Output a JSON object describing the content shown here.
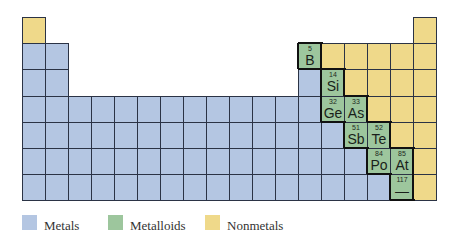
{
  "colors": {
    "metals": "#b4c6e2",
    "metalloids": "#9dc69d",
    "nonmetals": "#efd98a",
    "grid_line": "#2b3345"
  },
  "grid": {
    "left": 22,
    "top": 17,
    "cell_w": 23,
    "cell_h": 26.2,
    "columns": 18,
    "rows": 7
  },
  "rows": [
    {
      "row": 1,
      "cells": [
        {
          "col": 1,
          "type": "nonmetal"
        },
        {
          "col": 18,
          "type": "nonmetal"
        }
      ]
    },
    {
      "row": 2,
      "cells": [
        {
          "col": 1,
          "type": "metal"
        },
        {
          "col": 2,
          "type": "metal"
        },
        {
          "col": 13,
          "type": "metalloid",
          "number": "5",
          "symbol": "B"
        },
        {
          "col": 14,
          "type": "nonmetal"
        },
        {
          "col": 15,
          "type": "nonmetal"
        },
        {
          "col": 16,
          "type": "nonmetal"
        },
        {
          "col": 17,
          "type": "nonmetal"
        },
        {
          "col": 18,
          "type": "nonmetal"
        }
      ]
    },
    {
      "row": 3,
      "cells": [
        {
          "col": 1,
          "type": "metal"
        },
        {
          "col": 2,
          "type": "metal"
        },
        {
          "col": 13,
          "type": "metal"
        },
        {
          "col": 14,
          "type": "metalloid",
          "number": "14",
          "symbol": "Si"
        },
        {
          "col": 15,
          "type": "nonmetal"
        },
        {
          "col": 16,
          "type": "nonmetal"
        },
        {
          "col": 17,
          "type": "nonmetal"
        },
        {
          "col": 18,
          "type": "nonmetal"
        }
      ]
    },
    {
      "row": 4,
      "cells": [
        {
          "col": 1,
          "type": "metal"
        },
        {
          "col": 2,
          "type": "metal"
        },
        {
          "col": 3,
          "type": "metal"
        },
        {
          "col": 4,
          "type": "metal"
        },
        {
          "col": 5,
          "type": "metal"
        },
        {
          "col": 6,
          "type": "metal"
        },
        {
          "col": 7,
          "type": "metal"
        },
        {
          "col": 8,
          "type": "metal"
        },
        {
          "col": 9,
          "type": "metal"
        },
        {
          "col": 10,
          "type": "metal"
        },
        {
          "col": 11,
          "type": "metal"
        },
        {
          "col": 12,
          "type": "metal"
        },
        {
          "col": 13,
          "type": "metal"
        },
        {
          "col": 14,
          "type": "metalloid",
          "number": "32",
          "symbol": "Ge"
        },
        {
          "col": 15,
          "type": "metalloid",
          "number": "33",
          "symbol": "As"
        },
        {
          "col": 16,
          "type": "nonmetal"
        },
        {
          "col": 17,
          "type": "nonmetal"
        },
        {
          "col": 18,
          "type": "nonmetal"
        }
      ]
    },
    {
      "row": 5,
      "cells": [
        {
          "col": 1,
          "type": "metal"
        },
        {
          "col": 2,
          "type": "metal"
        },
        {
          "col": 3,
          "type": "metal"
        },
        {
          "col": 4,
          "type": "metal"
        },
        {
          "col": 5,
          "type": "metal"
        },
        {
          "col": 6,
          "type": "metal"
        },
        {
          "col": 7,
          "type": "metal"
        },
        {
          "col": 8,
          "type": "metal"
        },
        {
          "col": 9,
          "type": "metal"
        },
        {
          "col": 10,
          "type": "metal"
        },
        {
          "col": 11,
          "type": "metal"
        },
        {
          "col": 12,
          "type": "metal"
        },
        {
          "col": 13,
          "type": "metal"
        },
        {
          "col": 14,
          "type": "metal"
        },
        {
          "col": 15,
          "type": "metalloid",
          "number": "51",
          "symbol": "Sb"
        },
        {
          "col": 16,
          "type": "metalloid",
          "number": "52",
          "symbol": "Te"
        },
        {
          "col": 17,
          "type": "nonmetal"
        },
        {
          "col": 18,
          "type": "nonmetal"
        }
      ]
    },
    {
      "row": 6,
      "cells": [
        {
          "col": 1,
          "type": "metal"
        },
        {
          "col": 2,
          "type": "metal"
        },
        {
          "col": 3,
          "type": "metal"
        },
        {
          "col": 4,
          "type": "metal"
        },
        {
          "col": 5,
          "type": "metal"
        },
        {
          "col": 6,
          "type": "metal"
        },
        {
          "col": 7,
          "type": "metal"
        },
        {
          "col": 8,
          "type": "metal"
        },
        {
          "col": 9,
          "type": "metal"
        },
        {
          "col": 10,
          "type": "metal"
        },
        {
          "col": 11,
          "type": "metal"
        },
        {
          "col": 12,
          "type": "metal"
        },
        {
          "col": 13,
          "type": "metal"
        },
        {
          "col": 14,
          "type": "metal"
        },
        {
          "col": 15,
          "type": "metal"
        },
        {
          "col": 16,
          "type": "metalloid",
          "number": "84",
          "symbol": "Po"
        },
        {
          "col": 17,
          "type": "metalloid",
          "number": "85",
          "symbol": "At"
        },
        {
          "col": 18,
          "type": "nonmetal"
        }
      ]
    },
    {
      "row": 7,
      "cells": [
        {
          "col": 1,
          "type": "metal"
        },
        {
          "col": 2,
          "type": "metal"
        },
        {
          "col": 3,
          "type": "metal"
        },
        {
          "col": 4,
          "type": "metal"
        },
        {
          "col": 5,
          "type": "metal"
        },
        {
          "col": 6,
          "type": "metal"
        },
        {
          "col": 7,
          "type": "metal"
        },
        {
          "col": 8,
          "type": "metal"
        },
        {
          "col": 9,
          "type": "metal"
        },
        {
          "col": 10,
          "type": "metal"
        },
        {
          "col": 11,
          "type": "metal"
        },
        {
          "col": 12,
          "type": "metal"
        },
        {
          "col": 13,
          "type": "metal"
        },
        {
          "col": 14,
          "type": "metal"
        },
        {
          "col": 15,
          "type": "metal"
        },
        {
          "col": 16,
          "type": "metal"
        },
        {
          "col": 17,
          "type": "metalloid",
          "number": "117",
          "symbol": "—"
        },
        {
          "col": 18,
          "type": "nonmetal"
        }
      ]
    }
  ],
  "legend": [
    {
      "label": "Metals",
      "type": "metal"
    },
    {
      "label": "Metalloids",
      "type": "metalloid"
    },
    {
      "label": "Nonmetals",
      "type": "nonmetal"
    }
  ]
}
